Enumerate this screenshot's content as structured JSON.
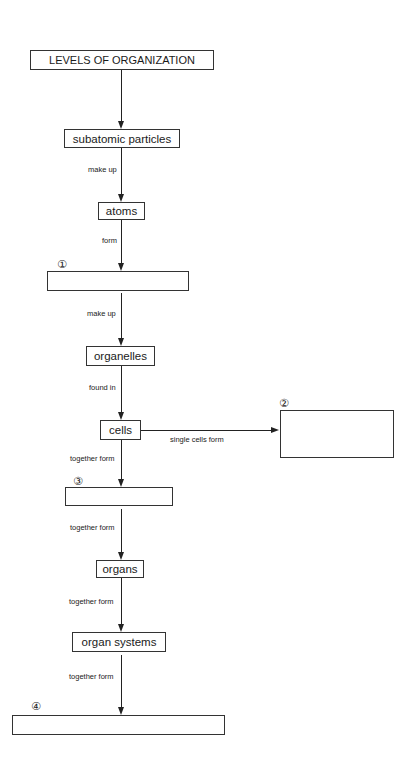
{
  "diagram": {
    "title": "LEVELS OF ORGANIZATION",
    "nodes": [
      {
        "id": "subatomic",
        "label": "subatomic particles"
      },
      {
        "id": "atoms",
        "label": "atoms"
      },
      {
        "id": "blank1",
        "label": "",
        "number": "①"
      },
      {
        "id": "organelles",
        "label": "organelles"
      },
      {
        "id": "cells",
        "label": "cells"
      },
      {
        "id": "blank2",
        "label": "",
        "number": "②"
      },
      {
        "id": "blank3",
        "label": "",
        "number": "③"
      },
      {
        "id": "organs",
        "label": "organs"
      },
      {
        "id": "organ_systems",
        "label": "organ systems"
      },
      {
        "id": "blank4",
        "label": "",
        "number": "④"
      }
    ],
    "edges": [
      {
        "from": "title",
        "to": "subatomic",
        "label": ""
      },
      {
        "from": "subatomic",
        "to": "atoms",
        "label": "make up"
      },
      {
        "from": "atoms",
        "to": "blank1",
        "label": "form"
      },
      {
        "from": "blank1",
        "to": "organelles",
        "label": "make up"
      },
      {
        "from": "organelles",
        "to": "cells",
        "label": "found in"
      },
      {
        "from": "cells",
        "to": "blank2",
        "label": "single cells form"
      },
      {
        "from": "cells",
        "to": "blank3",
        "label": "together form"
      },
      {
        "from": "blank3",
        "to": "organs",
        "label": "together form"
      },
      {
        "from": "organs",
        "to": "organ_systems",
        "label": "together form"
      },
      {
        "from": "organ_systems",
        "to": "blank4",
        "label": "together form"
      }
    ]
  }
}
